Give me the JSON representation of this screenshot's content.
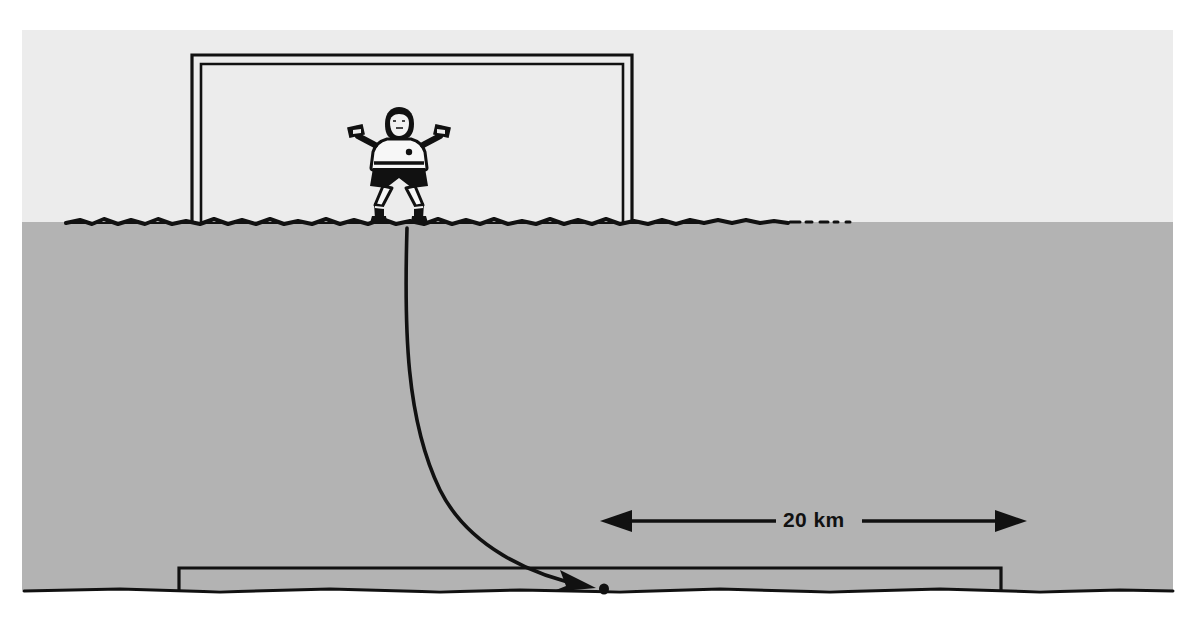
{
  "figure": {
    "caption": "",
    "width": 1198,
    "height": 618
  },
  "colors": {
    "page_background": "#ffffff",
    "sky": "#ececec",
    "ground": "#b3b3b3",
    "ink": "#111111",
    "goal_frame": "#111111",
    "label_text": "#111111"
  },
  "scene": {
    "sky_region": {
      "name": "sky",
      "x": 22,
      "y": 30,
      "width": 1151,
      "height": 192
    },
    "ground_region": {
      "name": "ground",
      "x": 22,
      "y": 222,
      "width": 1151,
      "height": 368
    },
    "grass_line": {
      "name": "grass-horizon-line",
      "y": 222
    },
    "lower_ground_line": {
      "name": "lower-ground-line",
      "y": 590
    }
  },
  "near_goal": {
    "name": "near-goal",
    "left_post_x": 196,
    "right_post_x": 628,
    "crossbar_y": 58,
    "base_y": 222,
    "frame_style": "double-line"
  },
  "far_goal": {
    "name": "far-goal",
    "left_post_x": 179,
    "right_post_x": 1001,
    "crossbar_y": 568,
    "base_y": 590,
    "frame_style": "single-line"
  },
  "goalkeeper": {
    "name": "goalkeeper-figure",
    "center_x": 399,
    "head_top_y": 112,
    "feet_y": 224,
    "arm_span_left_x": 348,
    "arm_span_right_x": 452,
    "pose": "arms-outstretched",
    "kit": "white-shirt-black-shorts"
  },
  "trajectory": {
    "name": "ball-trajectory",
    "start_x": 407,
    "start_y": 228,
    "end_x": 603,
    "end_y": 589,
    "arrowhead": "at-end",
    "shape": "curved-descending-right"
  },
  "ball": {
    "name": "ball-marker",
    "x": 604,
    "y": 589,
    "radius": 5
  },
  "measurement": {
    "name": "distance-measure",
    "label": "20 km",
    "label_x": 783,
    "label_y": 510,
    "line_y": 521,
    "left_arrow_tip_x": 600,
    "right_arrow_tip_x": 1027,
    "gap_left_x": 776,
    "gap_right_x": 862,
    "arrow_style": "double-headed"
  },
  "chart_data": {
    "type": "diagram",
    "annotations": [
      {
        "text": "20 km",
        "kind": "distance-label",
        "x": 783,
        "y": 510
      }
    ],
    "elements": [
      {
        "name": "near-goal",
        "kind": "soccer-goal",
        "scale": "near"
      },
      {
        "name": "goalkeeper",
        "kind": "human-figure",
        "pose": "arms-out"
      },
      {
        "name": "ball-trajectory",
        "kind": "curved-arrow"
      },
      {
        "name": "far-goal",
        "kind": "soccer-goal",
        "scale": "far"
      },
      {
        "name": "distance-measure",
        "kind": "double-arrow",
        "value": 20,
        "unit": "km"
      }
    ]
  }
}
